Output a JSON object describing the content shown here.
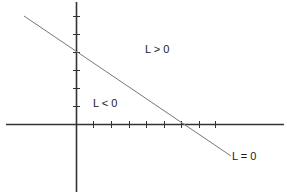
{
  "diagram": {
    "labels": {
      "region_positive": "L > 0",
      "region_negative": "L < 0",
      "boundary_line": "L = 0"
    },
    "axes": {
      "color": "#333333",
      "y_tick_count": 6,
      "x_tick_count": 8
    },
    "line": {
      "color": "#777777"
    }
  }
}
